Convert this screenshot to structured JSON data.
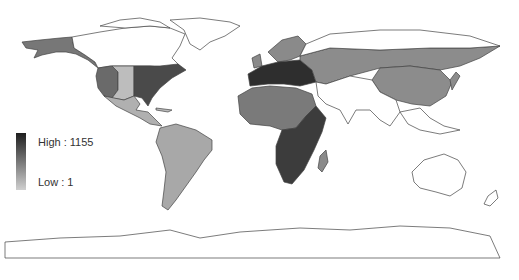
{
  "map": {
    "type": "choropleth",
    "projection": "world",
    "colorscale": [
      "#cfcfcf",
      "#1e1e1e"
    ],
    "legend": {
      "high_label": "High : 1155",
      "low_label": "Low : 1",
      "high_value": 1155,
      "low_value": 1
    },
    "regions": [
      {
        "name": "Greenland",
        "shade": "#ffffff"
      },
      {
        "name": "Canada (north)",
        "shade": "#ffffff"
      },
      {
        "name": "Alaska",
        "shade": "#777777"
      },
      {
        "name": "Western USA",
        "shade": "#6a6a6a"
      },
      {
        "name": "Central USA",
        "shade": "#bdbdbd"
      },
      {
        "name": "Eastern USA",
        "shade": "#4a4a4a"
      },
      {
        "name": "Mexico",
        "shade": "#b0b0b0"
      },
      {
        "name": "South America",
        "shade": "#a8a8a8"
      },
      {
        "name": "Europe (south)",
        "shade": "#2e2e2e"
      },
      {
        "name": "Northern Europe",
        "shade": "#8a8a8a"
      },
      {
        "name": "Russia / Central Asia",
        "shade": "#8c8c8c"
      },
      {
        "name": "China",
        "shade": "#8c8c8c"
      },
      {
        "name": "Africa (north/west)",
        "shade": "#7a7a7a"
      },
      {
        "name": "Africa (east/south)",
        "shade": "#3c3c3c"
      },
      {
        "name": "Madagascar",
        "shade": "#8a8a8a"
      },
      {
        "name": "Middle East / South Asia",
        "shade": "#ffffff"
      },
      {
        "name": "Australia",
        "shade": "#ffffff"
      },
      {
        "name": "Antarctica",
        "shade": "#ffffff"
      }
    ]
  }
}
